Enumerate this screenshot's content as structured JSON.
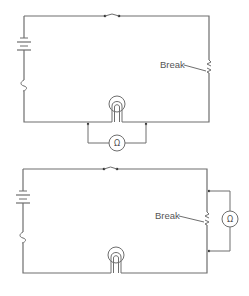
{
  "diagram": {
    "type": "circuit-schematic",
    "colors": {
      "wire": "#6e6e6e",
      "text": "#555555",
      "background": "#ffffff"
    },
    "circuits": [
      {
        "id": "top",
        "description": "Ohmmeter connected across lamp; break in right-side wire",
        "components": [
          "battery",
          "switch",
          "fuse",
          "lamp",
          "break",
          "ohmmeter"
        ],
        "break_label": "Break",
        "meter_symbol": "Ω",
        "meter_position": "across lamp (below bottom wire)"
      },
      {
        "id": "bottom",
        "description": "Ohmmeter connected across break in right-side wire",
        "components": [
          "battery",
          "switch",
          "fuse",
          "lamp",
          "break",
          "ohmmeter"
        ],
        "break_label": "Break",
        "meter_symbol": "Ω",
        "meter_position": "across break (right of right wire)"
      }
    ]
  }
}
